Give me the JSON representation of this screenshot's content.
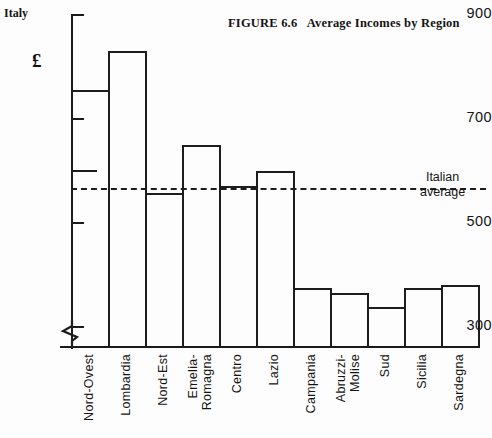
{
  "figure": {
    "title": "FIGURE 6.6   Average Incomes by Region",
    "corner_label": "Italy",
    "currency_symbol": "£"
  },
  "average_line": {
    "label_line1": "Italian",
    "label_line2": "average",
    "value": 567
  },
  "chart_data": {
    "type": "bar",
    "title": "FIGURE 6.6   Average Incomes by Region",
    "xlabel": "",
    "ylabel": "£",
    "ylim": [
      260,
      900
    ],
    "grid": false,
    "legend": null,
    "axis_broken": true,
    "yticks": [
      300,
      500,
      700,
      900
    ],
    "ytick_labels": [
      "300",
      "500",
      "700",
      "900"
    ],
    "minor_yticks": [
      600
    ],
    "categories": [
      "Nord-Ovest",
      "Lombardia",
      "Nord-Est",
      "Emelia-Romagna",
      "Centro",
      "Lazio",
      "Campania",
      "Abruzzi-Molise",
      "Sud",
      "Sicilia",
      "Sardegna"
    ],
    "category_lines": [
      [
        "Nord-Ovest"
      ],
      [
        "Lombardia"
      ],
      [
        "Nord-Est"
      ],
      [
        "Emelia-",
        "Romagna"
      ],
      [
        "Centro"
      ],
      [
        "Lazio"
      ],
      [
        "Campania"
      ],
      [
        "Abruzzi-",
        "Molise"
      ],
      [
        "Sud"
      ],
      [
        "Sicilia"
      ],
      [
        "Sardegna"
      ]
    ],
    "values": [
      755,
      830,
      558,
      650,
      572,
      600,
      375,
      365,
      338,
      375,
      382
    ],
    "annotations": [
      {
        "text": "Italian average",
        "type": "reference-line",
        "value": 567
      }
    ]
  },
  "colors": {
    "ink": "#1a1a1a",
    "background": "#fdfdfd"
  }
}
